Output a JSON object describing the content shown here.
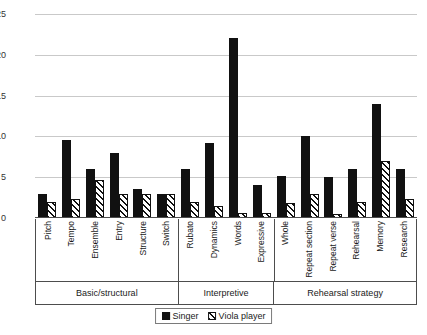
{
  "chart_data": {
    "type": "bar",
    "title": "",
    "xlabel": "",
    "ylabel": "",
    "ylim": [
      0,
      25
    ],
    "yticks": [
      0,
      5,
      10,
      15,
      20,
      25
    ],
    "grid": true,
    "legend_position": "bottom",
    "categories": [
      "Pitch",
      "Tempo",
      "Ensemble",
      "Entry",
      "Structure",
      "Switch",
      "Rubato",
      "Dynamics",
      "Words",
      "Expressive",
      "Whole",
      "Repeat section",
      "Repeat verse",
      "Rehearsal",
      "Memory",
      "Research"
    ],
    "series": [
      {
        "name": "Singer",
        "values": [
          3,
          9.5,
          6,
          8,
          3.5,
          3,
          6,
          9.2,
          22,
          4,
          5.2,
          10,
          5,
          6,
          14,
          6
        ]
      },
      {
        "name": "Viola player",
        "values": [
          2,
          2.3,
          4.7,
          3,
          3,
          3,
          2,
          1.5,
          0.6,
          0.6,
          1.8,
          3,
          0.5,
          2,
          7,
          2.3
        ]
      }
    ],
    "groups": [
      {
        "label": "Basic/structural",
        "span": 6
      },
      {
        "label": "Interpretive",
        "span": 4
      },
      {
        "label": "Rehearsal strategy",
        "span": 6
      }
    ],
    "colors": {
      "singer": "#111111",
      "viola": "#ffffff",
      "grid": "#c9c9c9",
      "axis": "#4d4d4d",
      "text": "#1a1a1a"
    }
  }
}
